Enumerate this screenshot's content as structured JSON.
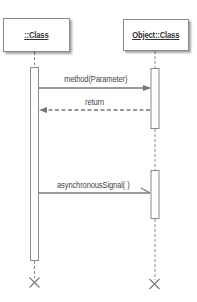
{
  "diagram": {
    "type": "UML sequence diagram",
    "lifelines": [
      {
        "id": "left",
        "label": "::Class"
      },
      {
        "id": "right",
        "label": "Object::Class"
      }
    ],
    "messages": [
      {
        "label": "method(Parameter)",
        "from": "left",
        "to": "right",
        "kind": "synchronous"
      },
      {
        "label": "return",
        "from": "right",
        "to": "left",
        "kind": "return"
      },
      {
        "label": "asynchronousSignal( )",
        "from": "left",
        "to": "right",
        "kind": "asynchronous"
      }
    ],
    "colors": {
      "line": "#777777",
      "box_border": "#8a8a8a",
      "text": "#444444"
    }
  }
}
